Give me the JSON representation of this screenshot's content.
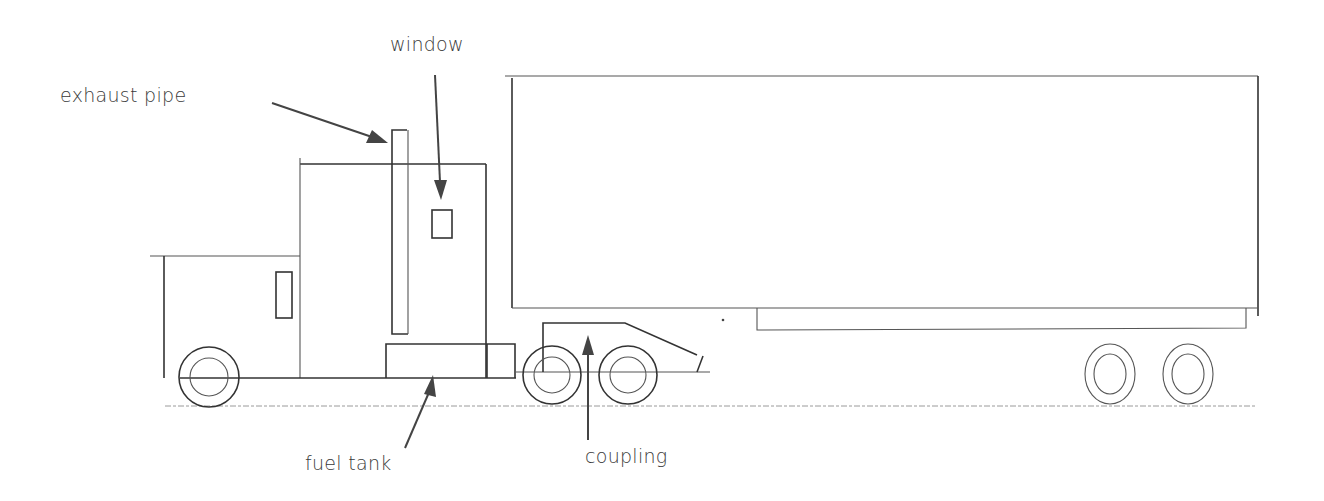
{
  "diagram": {
    "labels": {
      "exhaust_pipe": "exhaust pipe",
      "window": "window",
      "fuel_tank": "fuel tank",
      "coupling": "coupling"
    },
    "colors": {
      "line": "#333333",
      "text": "#3a3a3a",
      "background": "#ffffff"
    }
  }
}
